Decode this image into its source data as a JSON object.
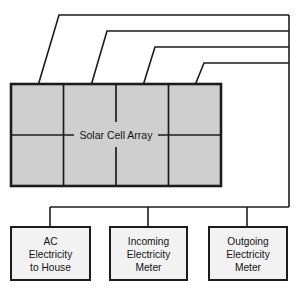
{
  "diagram": {
    "colors": {
      "panel_fill": "#cfcfcf",
      "box_fill": "#f2f2f2",
      "line": "#1c1c1c",
      "background": "#ffffff"
    },
    "solar_array": {
      "label": "Solar Cell Array",
      "columns": 4,
      "rows": 2,
      "x": 11,
      "y": 84,
      "width": 210,
      "height": 102
    },
    "feeder_lines": {
      "count": 4,
      "horizontal_y": [
        15,
        31,
        47,
        63
      ],
      "bus_vertical_x": 289,
      "bus_horizontal_y": 207,
      "bus_left_x": 50
    },
    "nodes": [
      {
        "name": "ac-electricity-to-house",
        "lines": [
          "AC",
          "Electricity",
          "to House"
        ],
        "x": 11,
        "y": 227,
        "width": 79,
        "height": 53,
        "drop_x": 50
      },
      {
        "name": "incoming-electricity-meter",
        "lines": [
          "Incoming",
          "Electricity",
          "Meter"
        ],
        "x": 110,
        "y": 227,
        "width": 77,
        "height": 53,
        "drop_x": 148
      },
      {
        "name": "outgoing-electricity-meter",
        "lines": [
          "Outgoing",
          "Electricity",
          "Meter"
        ],
        "x": 209,
        "y": 227,
        "width": 78,
        "height": 53,
        "drop_x": 247
      }
    ]
  }
}
